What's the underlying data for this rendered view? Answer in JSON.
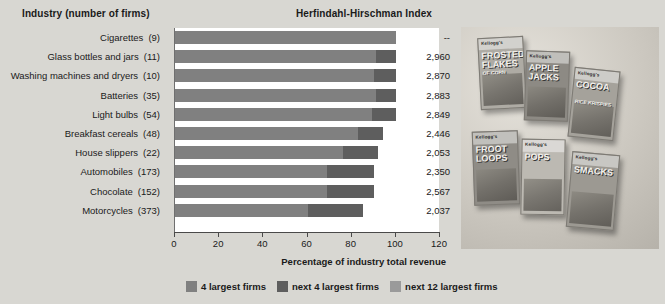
{
  "headers": {
    "industry": "Industry (number of firms)",
    "hhi": "Herfindahl-Hirschman Index"
  },
  "axis": {
    "title": "Percentage of industry total revenue",
    "ticks": [
      0,
      20,
      40,
      60,
      80,
      100,
      120
    ],
    "min": 0,
    "max": 120
  },
  "legend": [
    {
      "label": "4 largest firms",
      "color": "#808080"
    },
    {
      "label": "next 4 largest firms",
      "color": "#5e5e5e"
    },
    {
      "label": "next 12 largest firms",
      "color": "#9a9a9a"
    }
  ],
  "chart_data": {
    "type": "bar",
    "xlabel": "Percentage of industry total revenue",
    "ylabel": "Industry (number of firms)",
    "xlim": [
      0,
      120
    ],
    "grid": false,
    "legend_position": "bottom",
    "stacked": true,
    "categories": [
      "Cigarettes",
      "Glass bottles and jars",
      "Washing machines and dryers",
      "Batteries",
      "Light bulbs",
      "Breakfast cereals",
      "House slippers",
      "Automobiles",
      "Chocolate",
      "Motorcycles"
    ],
    "firm_counts": [
      9,
      11,
      10,
      35,
      54,
      48,
      22,
      173,
      152,
      373
    ],
    "series": [
      {
        "name": "4 largest firms",
        "color": "#808080",
        "values": [
          100,
          91,
          90,
          91,
          89,
          83,
          76,
          69,
          69,
          60
        ]
      },
      {
        "name": "next 4 largest firms",
        "color": "#5e5e5e",
        "values": [
          0,
          9,
          10,
          9,
          11,
          11,
          16,
          21,
          21,
          25
        ]
      },
      {
        "name": "next 12 largest firms",
        "color": "#9a9a9a",
        "values": [
          0,
          0,
          0,
          0,
          0,
          0,
          0,
          0,
          0,
          0
        ]
      }
    ],
    "hhi_values": [
      "--",
      "2,960",
      "2,870",
      "2,883",
      "2,849",
      "2,446",
      "2,053",
      "2,350",
      "2,567",
      "2,037"
    ],
    "rows": [
      {
        "industry": "Cigarettes",
        "firms": "(9)",
        "top4": 100,
        "next4": 0,
        "hhi": "--"
      },
      {
        "industry": "Glass bottles and jars",
        "firms": "(11)",
        "top4": 91,
        "next4": 9,
        "hhi": "2,960"
      },
      {
        "industry": "Washing machines and dryers",
        "firms": "(10)",
        "top4": 90,
        "next4": 10,
        "hhi": "2,870"
      },
      {
        "industry": "Batteries",
        "firms": "(35)",
        "top4": 91,
        "next4": 9,
        "hhi": "2,883"
      },
      {
        "industry": "Light bulbs",
        "firms": "(54)",
        "top4": 89,
        "next4": 11,
        "hhi": "2,849"
      },
      {
        "industry": "Breakfast cereals",
        "firms": "(48)",
        "top4": 83,
        "next4": 11,
        "hhi": "2,446"
      },
      {
        "industry": "House slippers",
        "firms": "(22)",
        "top4": 76,
        "next4": 16,
        "hhi": "2,053"
      },
      {
        "industry": "Automobiles",
        "firms": "(173)",
        "top4": 69,
        "next4": 21,
        "hhi": "2,350"
      },
      {
        "industry": "Chocolate",
        "firms": "(152)",
        "top4": 69,
        "next4": 21,
        "hhi": "2,567"
      },
      {
        "industry": "Motorcycles",
        "firms": "(373)",
        "top4": 60,
        "next4": 25,
        "hhi": "2,037"
      }
    ]
  },
  "photo": {
    "caption": "Photograph of six Kellogg's breakfast cereal boxes",
    "boxes": [
      {
        "brand": "Kellogg's",
        "title": "FROSTED FLAKES",
        "sub": "OF CORN"
      },
      {
        "brand": "Kellogg's",
        "title": "APPLE JACKS",
        "sub": ""
      },
      {
        "brand": "Kellogg's",
        "title": "COCOA",
        "sub": "RICE KRISPIES"
      },
      {
        "brand": "Kellogg's",
        "title": "FROOT LOOPS",
        "sub": ""
      },
      {
        "brand": "Kellogg's",
        "title": "POPS",
        "sub": ""
      },
      {
        "brand": "Kellogg's",
        "title": "SMACKS",
        "sub": ""
      }
    ]
  }
}
